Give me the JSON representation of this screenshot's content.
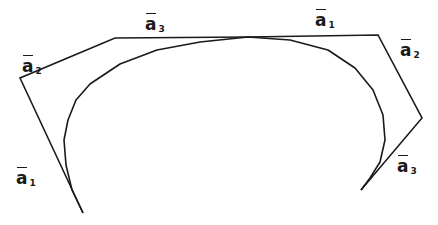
{
  "diagram": {
    "stroke_color": "#1a1a1a",
    "background": "#ffffff",
    "control_polygon_left": [
      [
        83,
        213
      ],
      [
        20,
        78
      ],
      [
        115,
        38
      ],
      [
        248,
        37
      ]
    ],
    "control_polygon_right": [
      [
        248,
        37
      ],
      [
        378,
        35
      ],
      [
        422,
        118
      ],
      [
        361,
        190
      ]
    ],
    "curve": [
      [
        83,
        213
      ],
      [
        72,
        190
      ],
      [
        66,
        165
      ],
      [
        64,
        140
      ],
      [
        68,
        120
      ],
      [
        76,
        100
      ],
      [
        90,
        84
      ],
      [
        120,
        64
      ],
      [
        157,
        50
      ],
      [
        200,
        42
      ],
      [
        248,
        37
      ],
      [
        290,
        40
      ],
      [
        328,
        50
      ],
      [
        355,
        68
      ],
      [
        373,
        90
      ],
      [
        383,
        115
      ],
      [
        385,
        140
      ],
      [
        380,
        162
      ],
      [
        370,
        178
      ],
      [
        361,
        190
      ]
    ],
    "labels": [
      {
        "id": "a2-left",
        "letter": "a",
        "subscript": "2",
        "x": 22,
        "y": 58
      },
      {
        "id": "a3-top",
        "letter": "a",
        "subscript": "3",
        "x": 145,
        "y": 16
      },
      {
        "id": "a1-bottom-left",
        "letter": "a",
        "subscript": "1",
        "x": 16,
        "y": 170
      },
      {
        "id": "a1-top",
        "letter": "a",
        "subscript": "1",
        "x": 315,
        "y": 12
      },
      {
        "id": "a2-right",
        "letter": "a",
        "subscript": "2",
        "x": 400,
        "y": 42
      },
      {
        "id": "a3-bottom-right",
        "letter": "a",
        "subscript": "3",
        "x": 397,
        "y": 158
      }
    ]
  }
}
